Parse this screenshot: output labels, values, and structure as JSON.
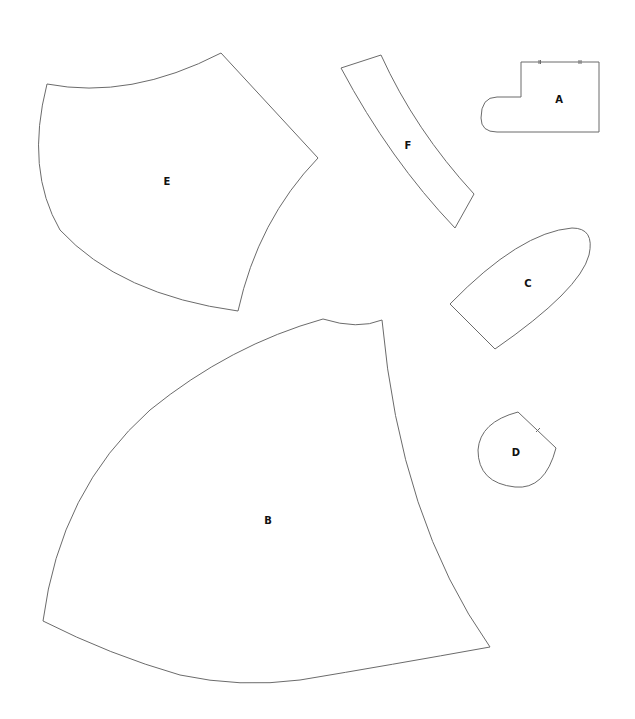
{
  "pattern": {
    "pieces": [
      {
        "id": "A",
        "label": "A"
      },
      {
        "id": "B",
        "label": "B"
      },
      {
        "id": "C",
        "label": "C"
      },
      {
        "id": "D",
        "label": "D"
      },
      {
        "id": "E",
        "label": "E"
      },
      {
        "id": "F",
        "label": "F"
      }
    ]
  },
  "colors": {
    "outline": "#6b6b6b",
    "label": "#111111",
    "background": "#ffffff"
  }
}
